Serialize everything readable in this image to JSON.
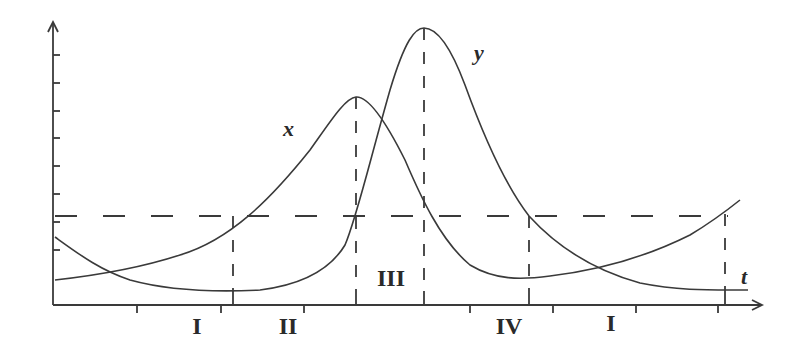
{
  "figure": {
    "type": "predator-prey phase diagram over time",
    "axis_x_label": "t",
    "curve_labels": {
      "x": "x",
      "y": "y"
    },
    "region_labels": [
      "I",
      "II",
      "III",
      "IV",
      "I"
    ],
    "colors": {
      "line": "#3a3a3a",
      "background": "#ffffff",
      "text": "#2a2a2a"
    }
  },
  "axes": {
    "y_axis": {
      "x": 53,
      "top": 22,
      "bottom": 305,
      "ticks_y": [
        55,
        83,
        111,
        138,
        166,
        194,
        222,
        250
      ]
    },
    "x_axis": {
      "y": 305,
      "left": 53,
      "right": 762,
      "ticks_below_x": [
        137,
        221,
        304,
        470,
        553,
        636,
        718
      ],
      "ticks_above_x": [
        233,
        356,
        424,
        529,
        725
      ]
    }
  },
  "guides": {
    "horizontal_dashed_y": 216,
    "vertical_dashed_x": [
      233,
      356,
      424,
      529,
      725
    ]
  },
  "curves": {
    "x": {
      "label": "x",
      "path": "M55,280 C100,275 140,268 180,255 C230,240 270,200 310,150 C330,122 345,98 356,97 C368,96 385,120 405,160 C420,195 440,240 470,265 C495,280 520,280 550,276 C600,270 650,255 690,235 C715,220 730,208 740,200"
    },
    "y": {
      "label": "y",
      "path": "M55,237 C80,255 100,270 130,280 C170,291 220,292 260,290 C300,285 330,270 345,245 C356,220 370,160 390,90 C405,40 415,28 424,28 C436,28 450,45 465,85 C485,140 505,185 529,216 C560,250 600,272 640,283 C680,291 710,290 748,290"
    }
  },
  "text_positions": {
    "x_label": {
      "x": 283,
      "y": 136
    },
    "y_label": {
      "x": 474,
      "y": 60
    },
    "t_label": {
      "x": 741,
      "y": 284
    },
    "regions": [
      {
        "label": "I",
        "x": 197,
        "y": 334
      },
      {
        "label": "II",
        "x": 288,
        "y": 334
      },
      {
        "label": "III",
        "x": 391,
        "y": 286
      },
      {
        "label": "IV",
        "x": 509,
        "y": 334
      },
      {
        "label": "I",
        "x": 611,
        "y": 331
      }
    ]
  }
}
